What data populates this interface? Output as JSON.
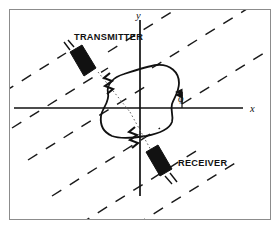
{
  "figure": {
    "type": "scattering-geometry-diagram",
    "background_color": "#ffffff",
    "ink_color": "#111111",
    "frame_color": "#8c8c8c",
    "labels": {
      "transmitter": "TRANSMITTER",
      "receiver": "RECEIVER",
      "x_axis": "x",
      "y_axis": "y",
      "angle": "φ"
    },
    "elements": {
      "target_name": "scattering-target-outline",
      "wavefronts_name": "incident-wavefront-dashed-lines",
      "wavefront_count": 9,
      "wavefront_angle_deg": 32,
      "transmitter_icon": "horn-antenna-icon",
      "receiver_icon": "horn-antenna-icon",
      "break_mark": "zigzag-break-mark",
      "break_mark_count": 2,
      "angle_marker": "phi-angle-arrow-marker",
      "ray_style": "dotted",
      "origin": {
        "x": 140,
        "y": 108
      }
    }
  }
}
